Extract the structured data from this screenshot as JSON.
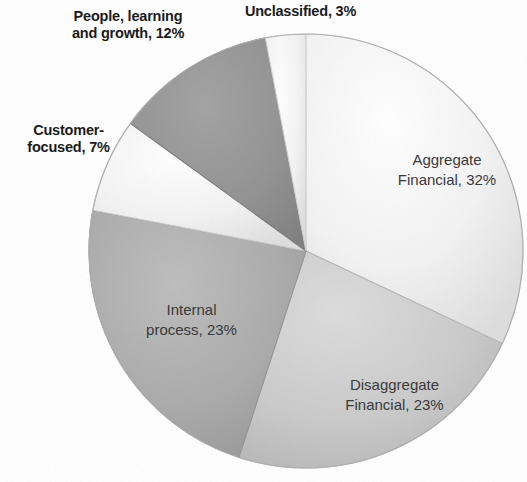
{
  "chart_data": {
    "type": "pie",
    "title": "",
    "subtitle": "",
    "xlabel": "",
    "ylabel": "",
    "legend_position": "none",
    "grid": false,
    "units": "percent",
    "start_angle_deg": 0,
    "direction": "clockwise",
    "total": 100,
    "categories": [
      "Aggregate Financial",
      "Disaggregate Financial",
      "Internal process",
      "Customer-focused",
      "People, learning and growth",
      "Unclassified"
    ],
    "values": [
      32,
      23,
      23,
      7,
      12,
      3
    ],
    "slices": [
      {
        "name": "Aggregate Financial",
        "value": 32,
        "label": "Aggregate\nFinancial, 32%",
        "label_placement": "inside",
        "color": "#eeeeee",
        "edge_color": "#d8d8d8",
        "start_deg": 0,
        "end_deg": 115.2
      },
      {
        "name": "Disaggregate Financial",
        "value": 23,
        "label": "Disaggregate\nFinancial, 23%",
        "label_placement": "inside",
        "color": "#c9c9c9",
        "edge_color": "#b4b4b4",
        "start_deg": 115.2,
        "end_deg": 198.0
      },
      {
        "name": "Internal process",
        "value": 23,
        "label": "Internal\nprocess, 23%",
        "label_placement": "inside",
        "color": "#a8a8a8",
        "edge_color": "#949494",
        "start_deg": 198.0,
        "end_deg": 280.8
      },
      {
        "name": "Customer-focused",
        "value": 7,
        "label": "Customer-\nfocused, 7%",
        "label_placement": "outside",
        "color": "#dcdcdc",
        "edge_color": "#c6c6c6",
        "start_deg": 280.8,
        "end_deg": 306.0
      },
      {
        "name": "People, learning and growth",
        "value": 12,
        "label": "People, learning\nand growth, 12%",
        "label_placement": "outside",
        "color": "#8e8e8e",
        "edge_color": "#7b7b7b",
        "start_deg": 306.0,
        "end_deg": 349.2
      },
      {
        "name": "Unclassified",
        "value": 3,
        "label": "Unclassified, 3%",
        "label_placement": "outside",
        "color": "#e4e4e4",
        "edge_color": "#cfcfcf",
        "start_deg": 349.2,
        "end_deg": 360.0
      }
    ],
    "geometry": {
      "center_x": 306,
      "center_y": 251,
      "radius": 217
    },
    "background_color": "#ffffff",
    "label_text_color_inside": "#3a3a3a",
    "label_text_color_outside": "#1b1b1b"
  }
}
